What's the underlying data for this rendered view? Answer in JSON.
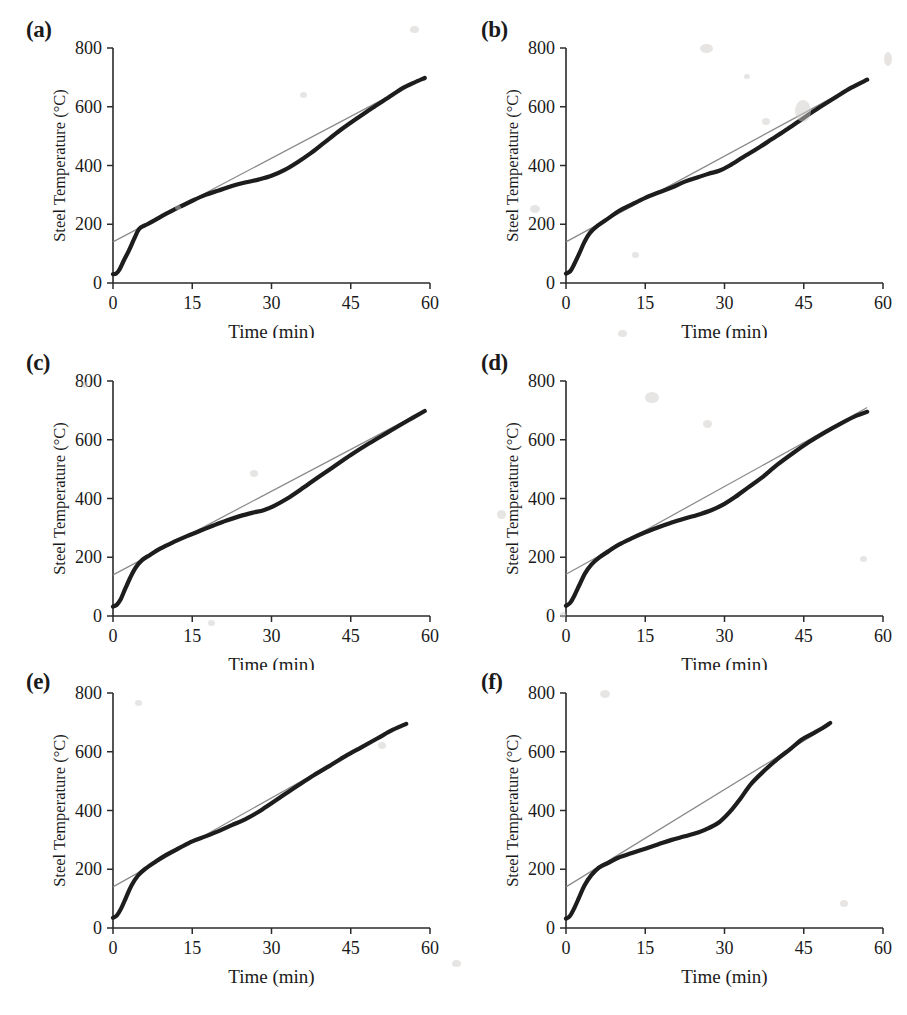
{
  "figure": {
    "panel_count": 6,
    "shared": {
      "ylabel": "Steel Temperature (°C)",
      "xlabel": "Time (min)",
      "y_ticks": [
        "0",
        "200",
        "400",
        "600",
        "800"
      ],
      "x_ticks": [
        "0",
        "15",
        "30",
        "45",
        "60"
      ],
      "curve_color": "#1d1d1d",
      "reference_color": "#8a8a8a",
      "background_color": "#ffffff"
    },
    "panels": [
      {
        "label": "(a)"
      },
      {
        "label": "(b)"
      },
      {
        "label": "(c)"
      },
      {
        "label": "(d)"
      },
      {
        "label": "(e)"
      },
      {
        "label": "(f)"
      }
    ]
  },
  "chart_data": [
    {
      "type": "line",
      "panel": "(a)",
      "title": "",
      "xlabel": "Time (min)",
      "ylabel": "Steel Temperature (°C)",
      "xlim": [
        0,
        60
      ],
      "ylim": [
        0,
        800
      ],
      "xticks": [
        0,
        15,
        30,
        45,
        60
      ],
      "yticks": [
        0,
        200,
        400,
        600,
        800
      ],
      "grid": false,
      "legend": "none",
      "series": [
        {
          "name": "Measured steel temperature",
          "style": "thick-solid",
          "x": [
            0,
            0.6,
            1.2,
            2.0,
            3.0,
            4.0,
            5.0,
            6.5,
            8.0,
            10.0,
            12.5,
            15.0,
            17.5,
            20.0,
            22.5,
            25.0,
            27.5,
            30.0,
            32.5,
            35.0,
            37.5,
            40.0,
            43.0,
            46.0,
            49.0,
            52.0,
            55.0,
            57.0,
            59.0
          ],
          "y": [
            30,
            32,
            45,
            75,
            110,
            150,
            185,
            200,
            215,
            235,
            258,
            280,
            300,
            315,
            330,
            342,
            352,
            365,
            385,
            412,
            443,
            478,
            520,
            558,
            595,
            630,
            665,
            682,
            698
          ]
        },
        {
          "name": "Linear reference line",
          "style": "thin-solid",
          "x": [
            0,
            59
          ],
          "y": [
            140,
            700
          ]
        }
      ]
    },
    {
      "type": "line",
      "panel": "(b)",
      "title": "",
      "xlabel": "Time (min)",
      "ylabel": "Steel Temperature (°C)",
      "xlim": [
        0,
        60
      ],
      "ylim": [
        0,
        800
      ],
      "xticks": [
        0,
        15,
        30,
        45,
        60
      ],
      "yticks": [
        0,
        200,
        400,
        600,
        800
      ],
      "grid": false,
      "legend": "none",
      "series": [
        {
          "name": "Measured steel temperature",
          "style": "thick-solid",
          "x": [
            0,
            0.8,
            1.5,
            2.5,
            3.5,
            4.5,
            6.0,
            8.0,
            10.0,
            12.5,
            15.0,
            17.5,
            20.0,
            22.5,
            25.0,
            27.0,
            29.0,
            31.0,
            33.5,
            36.0,
            39.0,
            42.0,
            45.0,
            48.0,
            51.0,
            54.0,
            57.0
          ],
          "y": [
            32,
            40,
            62,
            100,
            140,
            170,
            195,
            220,
            245,
            268,
            290,
            308,
            325,
            345,
            360,
            372,
            382,
            400,
            428,
            455,
            490,
            525,
            562,
            598,
            632,
            665,
            692
          ]
        },
        {
          "name": "Linear reference line",
          "style": "thin-solid",
          "x": [
            0,
            57
          ],
          "y": [
            140,
            695
          ]
        }
      ]
    },
    {
      "type": "line",
      "panel": "(c)",
      "title": "",
      "xlabel": "Time (min)",
      "ylabel": "Steel Temperature (°C)",
      "xlim": [
        0,
        60
      ],
      "ylim": [
        0,
        800
      ],
      "xticks": [
        0,
        15,
        30,
        45,
        60
      ],
      "yticks": [
        0,
        200,
        400,
        600,
        800
      ],
      "grid": false,
      "legend": "none",
      "series": [
        {
          "name": "Measured steel temperature",
          "style": "thick-solid",
          "x": [
            0,
            0.7,
            1.4,
            2.3,
            3.3,
            4.3,
            5.5,
            7.0,
            9.0,
            11.5,
            14.0,
            16.5,
            19.0,
            21.5,
            24.0,
            26.5,
            28.5,
            30.5,
            33.0,
            35.5,
            38.5,
            41.5,
            45.0,
            48.5,
            52.0,
            55.5,
            59.0
          ],
          "y": [
            32,
            38,
            55,
            92,
            132,
            165,
            190,
            208,
            230,
            252,
            272,
            290,
            308,
            325,
            340,
            352,
            360,
            375,
            400,
            430,
            468,
            505,
            548,
            588,
            625,
            662,
            698
          ]
        },
        {
          "name": "Linear reference line",
          "style": "thin-solid",
          "x": [
            0,
            59
          ],
          "y": [
            140,
            700
          ]
        }
      ]
    },
    {
      "type": "line",
      "panel": "(d)",
      "title": "",
      "xlabel": "Time (min)",
      "ylabel": "Steel Temperature (°C)",
      "xlim": [
        0,
        60
      ],
      "ylim": [
        0,
        800
      ],
      "xticks": [
        0,
        15,
        30,
        45,
        60
      ],
      "yticks": [
        0,
        200,
        400,
        600,
        800
      ],
      "grid": false,
      "legend": "none",
      "series": [
        {
          "name": "Measured steel temperature",
          "style": "thick-solid",
          "x": [
            0,
            0.8,
            1.6,
            2.6,
            3.6,
            4.8,
            6.2,
            8.0,
            10.0,
            12.5,
            15.0,
            17.5,
            20.0,
            22.5,
            25.0,
            27.5,
            30.0,
            32.0,
            34.5,
            37.0,
            40.0,
            43.0,
            46.0,
            49.0,
            52.0,
            55.0,
            57.0
          ],
          "y": [
            35,
            45,
            70,
            108,
            145,
            175,
            198,
            220,
            243,
            265,
            285,
            302,
            318,
            332,
            345,
            360,
            382,
            405,
            438,
            470,
            515,
            555,
            592,
            625,
            655,
            682,
            695
          ]
        },
        {
          "name": "Linear reference line",
          "style": "thin-solid",
          "x": [
            0,
            57
          ],
          "y": [
            142,
            710
          ]
        }
      ]
    },
    {
      "type": "line",
      "panel": "(e)",
      "title": "",
      "xlabel": "Time (min)",
      "ylabel": "Steel Temperature (°C)",
      "xlim": [
        0,
        60
      ],
      "ylim": [
        0,
        800
      ],
      "xticks": [
        0,
        15,
        30,
        45,
        60
      ],
      "yticks": [
        0,
        200,
        400,
        600,
        800
      ],
      "grid": false,
      "legend": "none",
      "series": [
        {
          "name": "Measured steel temperature",
          "style": "thick-solid",
          "x": [
            0,
            0.7,
            1.5,
            2.5,
            3.5,
            4.7,
            6.0,
            8.0,
            10.0,
            12.5,
            15.0,
            17.5,
            20.0,
            22.5,
            25.0,
            27.5,
            30.0,
            32.5,
            35.0,
            38.0,
            41.0,
            44.0,
            47.0,
            50.0,
            53.0,
            55.5
          ],
          "y": [
            35,
            42,
            65,
            105,
            145,
            178,
            200,
            225,
            248,
            272,
            295,
            312,
            330,
            350,
            370,
            395,
            425,
            455,
            485,
            520,
            552,
            585,
            615,
            645,
            675,
            695
          ]
        },
        {
          "name": "Linear reference line",
          "style": "thin-solid",
          "x": [
            0,
            55.5
          ],
          "y": [
            140,
            700
          ]
        }
      ]
    },
    {
      "type": "line",
      "panel": "(f)",
      "title": "",
      "xlabel": "Time (min)",
      "ylabel": "Steel Temperature (°C)",
      "xlim": [
        0,
        60
      ],
      "ylim": [
        0,
        800
      ],
      "xticks": [
        0,
        15,
        30,
        45,
        60
      ],
      "yticks": [
        0,
        200,
        400,
        600,
        800
      ],
      "grid": false,
      "legend": "none",
      "series": [
        {
          "name": "Measured steel temperature",
          "style": "thick-solid",
          "x": [
            0,
            0.7,
            1.5,
            2.5,
            3.5,
            4.8,
            6.2,
            8.0,
            10.0,
            12.5,
            15.0,
            17.5,
            20.0,
            22.5,
            25.0,
            27.0,
            29.0,
            31.0,
            33.0,
            35.0,
            37.5,
            40.0,
            42.5,
            44.5,
            46.5,
            48.5,
            50.0
          ],
          "y": [
            32,
            40,
            65,
            105,
            145,
            180,
            205,
            222,
            240,
            255,
            270,
            285,
            300,
            312,
            325,
            340,
            360,
            395,
            440,
            490,
            535,
            575,
            610,
            640,
            660,
            680,
            698
          ]
        },
        {
          "name": "Linear reference line",
          "style": "thin-solid",
          "x": [
            0,
            50
          ],
          "y": [
            140,
            692
          ]
        }
      ]
    }
  ]
}
